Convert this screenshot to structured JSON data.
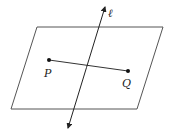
{
  "diagram": {
    "title": "",
    "plane": {
      "name": "plane",
      "corners": [
        [
          37,
          27
        ],
        [
          163,
          27
        ],
        [
          137,
          109
        ],
        [
          11,
          109
        ]
      ],
      "stroke": "#555555"
    },
    "line_l": {
      "label": "ℓ",
      "from": [
        68,
        128
      ],
      "to": [
        105,
        7
      ],
      "label_pos": [
        108,
        14
      ],
      "stroke": "#222222"
    },
    "points": [
      {
        "label": "P",
        "pos": [
          49,
          60
        ],
        "label_pos": [
          45,
          76
        ]
      },
      {
        "label": "Q",
        "pos": [
          128,
          71
        ],
        "label_pos": [
          123,
          87
        ]
      }
    ],
    "segment_PQ": {
      "from": "P",
      "to": "Q",
      "stroke": "#333333"
    }
  }
}
